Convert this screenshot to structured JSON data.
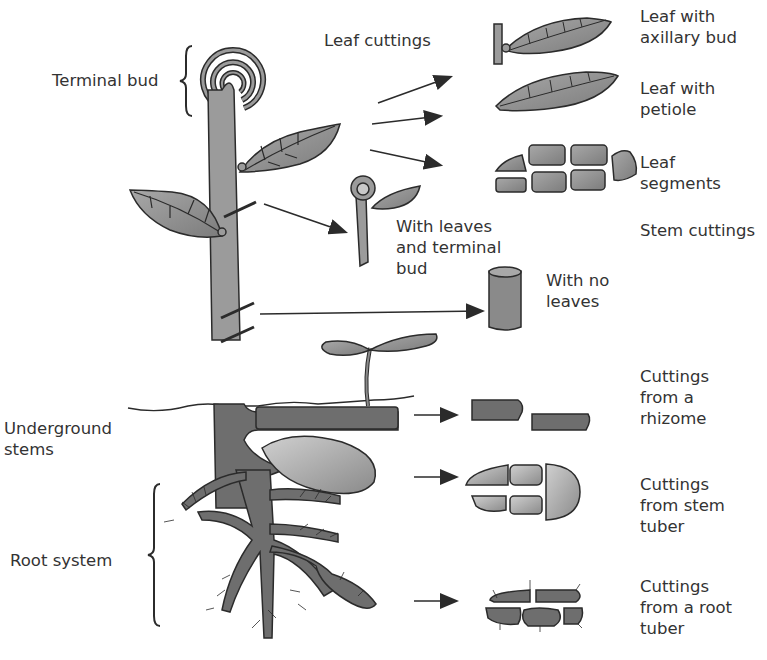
{
  "figure": {
    "colors": {
      "ink": "#2b2b2b",
      "stem_fill": "#9b9b9b",
      "leaf_fill": "#8f8f8f",
      "underground_fill": "#6e6e6e",
      "tuber_fill": "#b3b3b3",
      "background": "#ffffff",
      "text": "#333333"
    },
    "plant_labels": {
      "terminal_bud": "Terminal bud",
      "underground_stems": [
        "Underground",
        "stems"
      ],
      "root_system": "Root system"
    },
    "leaf_cuttings": {
      "heading": "Leaf cuttings",
      "items": [
        {
          "label": [
            "Leaf with",
            "axillary bud"
          ],
          "icon": "leaf-with-bud-icon"
        },
        {
          "label": [
            "Leaf with",
            "petiole"
          ],
          "icon": "leaf-with-petiole-icon"
        },
        {
          "label": [
            "Leaf",
            "segments"
          ],
          "icon": "leaf-segments-icon"
        }
      ]
    },
    "stem_cuttings": {
      "heading": "Stem cuttings",
      "items": [
        {
          "label": [
            "With leaves",
            "and terminal",
            "bud"
          ],
          "icon": "stem-with-leaves-icon"
        },
        {
          "label": [
            "With no",
            "leaves"
          ],
          "icon": "stem-no-leaves-icon"
        }
      ]
    },
    "underground_cuttings": [
      {
        "label": [
          "Cuttings",
          "from a",
          "rhizome"
        ],
        "icon": "rhizome-pieces-icon"
      },
      {
        "label": [
          "Cuttings",
          "from stem",
          "tuber"
        ],
        "icon": "stem-tuber-pieces-icon"
      },
      {
        "label": [
          "Cuttings",
          "from a root",
          "tuber"
        ],
        "icon": "root-tuber-pieces-icon"
      }
    ]
  }
}
